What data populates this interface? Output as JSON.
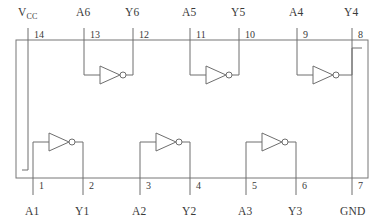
{
  "diagram": {
    "device_type": "hex-inverter-ic-pinout",
    "package": {
      "left": 16,
      "right": 368,
      "top": 40,
      "bottom": 178
    },
    "colors": {
      "line": "#6e6e6e",
      "outline": "#777777",
      "text": "#3a3a3a",
      "background": "#ffffff"
    },
    "top_pins": [
      {
        "number": "14",
        "label": "V",
        "sublabel": "CC",
        "x": 28,
        "num_x": 34,
        "label_x": 18
      },
      {
        "number": "13",
        "label": "A6",
        "sublabel": "",
        "x": 84,
        "num_x": 90,
        "label_x": 76
      },
      {
        "number": "12",
        "label": "Y6",
        "sublabel": "",
        "x": 133,
        "num_x": 139,
        "label_x": 125
      },
      {
        "number": "11",
        "label": "A5",
        "sublabel": "",
        "x": 190,
        "num_x": 196,
        "label_x": 182
      },
      {
        "number": "10",
        "label": "Y5",
        "sublabel": "",
        "x": 239,
        "num_x": 245,
        "label_x": 231
      },
      {
        "number": "9",
        "label": "A4",
        "sublabel": "",
        "x": 297,
        "num_x": 303,
        "label_x": 289
      },
      {
        "number": "8",
        "label": "Y4",
        "sublabel": "",
        "x": 352,
        "num_x": 358,
        "label_x": 344
      }
    ],
    "bottom_pins": [
      {
        "number": "1",
        "label": "A1",
        "x": 33,
        "num_x": 39,
        "label_x": 25
      },
      {
        "number": "2",
        "label": "Y1",
        "x": 83,
        "num_x": 89,
        "label_x": 75
      },
      {
        "number": "3",
        "label": "A2",
        "x": 140,
        "num_x": 146,
        "label_x": 132
      },
      {
        "number": "4",
        "label": "Y2",
        "x": 190,
        "num_x": 196,
        "label_x": 182
      },
      {
        "number": "5",
        "label": "A3",
        "x": 246,
        "num_x": 252,
        "label_x": 238
      },
      {
        "number": "6",
        "label": "Y3",
        "x": 296,
        "num_x": 302,
        "label_x": 288
      },
      {
        "number": "7",
        "label": "GND",
        "x": 352,
        "num_x": 358,
        "label_x": 340
      }
    ],
    "top_gates": [
      {
        "name": "inverter-6",
        "in_pin_x": 84,
        "out_pin_x": 133,
        "rail_y": 75,
        "tri_x": 100,
        "tri_y": 75
      },
      {
        "name": "inverter-5",
        "in_pin_x": 190,
        "out_pin_x": 239,
        "rail_y": 75,
        "tri_x": 206,
        "tri_y": 75
      },
      {
        "name": "inverter-4",
        "in_pin_x": 297,
        "out_pin_x": 352,
        "rail_y": 75,
        "tri_x": 313,
        "tri_y": 75
      }
    ],
    "bottom_gates": [
      {
        "name": "inverter-1",
        "in_pin_x": 33,
        "out_pin_x": 83,
        "rail_y": 142,
        "tri_x": 49,
        "tri_y": 142
      },
      {
        "name": "inverter-2",
        "in_pin_x": 140,
        "out_pin_x": 190,
        "rail_y": 142,
        "tri_x": 156,
        "tri_y": 142
      },
      {
        "name": "inverter-3",
        "in_pin_x": 246,
        "out_pin_x": 296,
        "rail_y": 142,
        "tri_x": 262,
        "tri_y": 142
      }
    ],
    "power_rail": {
      "vcc_x": 28,
      "vcc_drop_y": 170,
      "gnd_x": 352,
      "gnd_rise_y": 48
    },
    "geometry": {
      "pin_stub_top_y": 28,
      "pin_label_top_y": 16,
      "pin_num_top_y": 38,
      "pin_stub_bottom_y": 195,
      "pin_label_bottom_y": 215,
      "pin_num_bottom_y": 189,
      "triangle_width": 20,
      "triangle_height": 18,
      "bubble_radius": 3
    }
  }
}
